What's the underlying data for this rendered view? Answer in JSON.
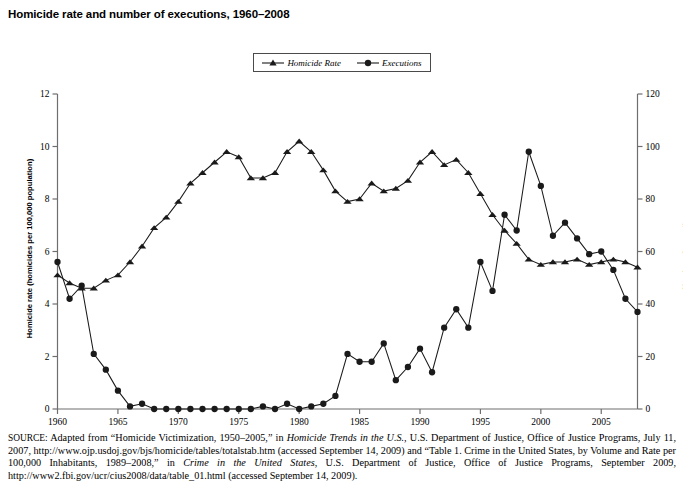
{
  "figure": {
    "title": "Homicide rate and number of executions, 1960–2008",
    "source_prefix": "SOURCE:",
    "source_text": " Adapted from “Homicide Victimization, 1950–2005,” in ",
    "source_italic_1": "Homicide Trends in the U.S.,",
    "source_text_2": "  U.S. Department of Justice, Office of Justice Programs, July 11, 2007, http://www.ojp.usdoj.gov/bjs/homicide/tables/totalstab.htm (accessed September 14, 2009) and “Table 1. Crime in the United States, by Volume and Rate per 100,000 Inhabitants, 1989–2008,” in ",
    "source_italic_2": "Crime in the United States",
    "source_text_3": ", U.S. Department of Justice, Office of Justice Programs, September 2009, http://www2.fbi.gov/ucr/cius2008/data/table_01.html (accessed September 14, 2009)."
  },
  "legend": {
    "position": "top-center",
    "items": [
      {
        "label": "Homicide Rate",
        "marker": "triangle-marker",
        "color": "#1a1a1a"
      },
      {
        "label": "Executions",
        "marker": "circle-marker",
        "color": "#1a1a1a"
      }
    ]
  },
  "chart_data": {
    "type": "line",
    "title": "Homicide rate and number of executions, 1960–2008",
    "xlabel": "",
    "ylabel": "Homicide rate (homicides per 100,000 population)",
    "y2label": "Number of executions",
    "grid": false,
    "xlim": [
      1960,
      2008
    ],
    "ylim": [
      0,
      12
    ],
    "y2lim": [
      0,
      120
    ],
    "xticks": [
      1960,
      1965,
      1970,
      1975,
      1980,
      1985,
      1990,
      1995,
      2000,
      2005
    ],
    "yticks": [
      0,
      2,
      4,
      6,
      8,
      10,
      12
    ],
    "y2ticks": [
      0,
      20,
      40,
      60,
      80,
      100,
      120
    ],
    "x": [
      1960,
      1961,
      1962,
      1963,
      1964,
      1965,
      1966,
      1967,
      1968,
      1969,
      1970,
      1971,
      1972,
      1973,
      1974,
      1975,
      1976,
      1977,
      1978,
      1979,
      1980,
      1981,
      1982,
      1983,
      1984,
      1985,
      1986,
      1987,
      1988,
      1989,
      1990,
      1991,
      1992,
      1993,
      1994,
      1995,
      1996,
      1997,
      1998,
      1999,
      2000,
      2001,
      2002,
      2003,
      2004,
      2005,
      2006,
      2007,
      2008
    ],
    "series": [
      {
        "name": "Homicide Rate",
        "axis": "left",
        "marker": "triangle-marker",
        "color": "#1a1a1a",
        "values": [
          5.1,
          4.8,
          4.6,
          4.6,
          4.9,
          5.1,
          5.6,
          6.2,
          6.9,
          7.3,
          7.9,
          8.6,
          9.0,
          9.4,
          9.8,
          9.6,
          8.8,
          8.8,
          9.0,
          9.8,
          10.2,
          9.8,
          9.1,
          8.3,
          7.9,
          8.0,
          8.6,
          8.3,
          8.4,
          8.7,
          9.4,
          9.8,
          9.3,
          9.5,
          9.0,
          8.2,
          7.4,
          6.8,
          6.3,
          5.7,
          5.5,
          5.6,
          5.6,
          5.7,
          5.5,
          5.6,
          5.7,
          5.6,
          5.4
        ],
        "marker_size": 4.4
      },
      {
        "name": "Executions",
        "axis": "right",
        "marker": "circle-marker",
        "color": "#1a1a1a",
        "values": [
          56,
          42,
          47,
          21,
          15,
          7,
          1,
          2,
          0,
          0,
          0,
          0,
          0,
          0,
          0,
          0,
          0,
          1,
          0,
          2,
          0,
          1,
          2,
          5,
          21,
          18,
          18,
          25,
          11,
          16,
          23,
          14,
          31,
          38,
          31,
          56,
          45,
          74,
          68,
          98,
          85,
          66,
          71,
          65,
          59,
          60,
          53,
          42,
          37
        ],
        "marker_size": 5.2
      }
    ]
  },
  "axes": {
    "left": {
      "label": "Homicide rate (homicides per 100,000 population)",
      "ticks": [
        "0",
        "2",
        "4",
        "6",
        "8",
        "10",
        "12"
      ]
    },
    "right": {
      "label": "Number of executions",
      "ticks": [
        "0",
        "20",
        "40",
        "60",
        "80",
        "100",
        "120"
      ]
    },
    "bottom": {
      "ticks": [
        "1960",
        "1965",
        "1970",
        "1975",
        "1980",
        "1985",
        "1990",
        "1995",
        "2000",
        "2005"
      ]
    }
  }
}
